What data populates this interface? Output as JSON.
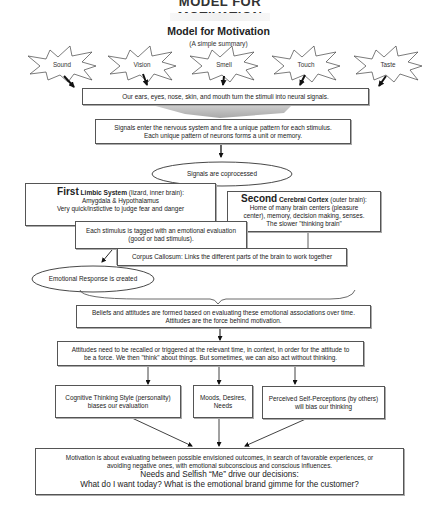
{
  "header": {
    "cut_title": "MODEL FOR MOTIVATION",
    "title": "Model for Motivation",
    "subtitle": "(A simple summary)"
  },
  "senses": [
    {
      "label": "Sound"
    },
    {
      "label": "Vision"
    },
    {
      "label": "Smell"
    },
    {
      "label": "Touch"
    },
    {
      "label": "Taste"
    }
  ],
  "stimuli_box": {
    "text": "Our ears, eyes, nose, skin, and mouth turn the stimuli into neural signals."
  },
  "signals_box": {
    "line1": "Signals enter the nervous system and fire a unique pattern for each stimulus.",
    "line2": "Each unique pattern of neurons forms a unit or memory."
  },
  "coprocessed_ellipse": {
    "text": "Signals are coprocessed"
  },
  "first_box": {
    "lead": "First",
    "system": "Limbic System",
    "note": " (lizard, inner brain):",
    "line2": "Amygdala & Hypothalamus",
    "line3": "Very quick/instictive to judge fear and danger"
  },
  "second_box": {
    "lead": "Second",
    "system": "Cerebral Cortex",
    "note": " (outer brain):",
    "line2": "Home of many brain centers (pleasure",
    "line3": "center), memory, decision making, senses.",
    "line4": "The slower \"thinking brain\""
  },
  "tagged_box": {
    "line1": "Each stimulus is tagged with an emotional evaluation",
    "line2": "(good or bad stimulus)."
  },
  "corpus_box": {
    "text": "Corpus Callosum: Links the different parts of the brain to work together"
  },
  "emotional_ellipse": {
    "text": "Emotional Response is created"
  },
  "beliefs_box": {
    "line1": "Beliefs and attitudes are formed based on evaluating these emotional associations over time.",
    "line2": "Attitudes are the force behind motivation."
  },
  "attitudes_box": {
    "line1": "Attitudes need to be recalled or triggered at the relevant time, in context, in order for the attitude to",
    "line2": "be a force. We then \"think\" about things. But sometimes, we can also act without thinking."
  },
  "influences": [
    {
      "line1": "Cognitive Thinking Style (personality)",
      "line2": "biases our evaluation"
    },
    {
      "line1": "Moods, Desires,",
      "line2": "Needs"
    },
    {
      "line1": "Perceived Self-Perceptions (by others)",
      "line2": "will bias our thinking"
    }
  ],
  "motivation_box": {
    "line1": "Motivation is about evaluating between possible envisioned outcomes, in search of favorable experiences, or",
    "line2": "avoiding negative ones, with emotional subconscious and conscious influences.",
    "line3": "Needs and Selfish “Me” drive our decisions:",
    "line4": "What do I want today? What is the emotional brand gimme for the customer?"
  },
  "colors": {
    "border": "#555555",
    "arrow": "#111111",
    "funnel": "#bdbdbd",
    "background": "#ffffff"
  }
}
